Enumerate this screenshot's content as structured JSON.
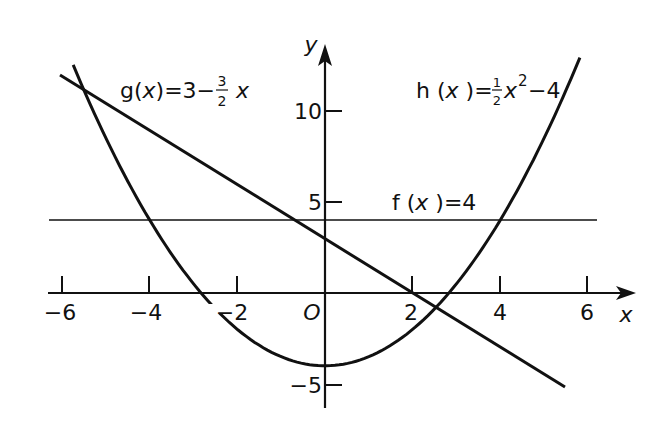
{
  "chart_data": {
    "type": "line",
    "title": "",
    "xlabel": "x",
    "ylabel": "y",
    "xlim": [
      -6.3,
      7.0
    ],
    "ylim": [
      -6.3,
      13.0
    ],
    "grid": false,
    "x_ticks": [
      -6,
      -4,
      -2,
      2,
      4,
      6
    ],
    "x_tick_labels": [
      "-6",
      "-4",
      "-2",
      "2",
      "4",
      "6"
    ],
    "y_ticks": [
      10,
      5,
      -5
    ],
    "y_tick_labels": [
      "10",
      "5",
      "-5"
    ],
    "origin_label": "O",
    "series": [
      {
        "name": "f(x)=4",
        "expression": "4",
        "x_range": [
          -6.3,
          6.2
        ],
        "x": [
          -6.3,
          6.2
        ],
        "y": [
          4,
          4
        ]
      },
      {
        "name": "g(x)=3-3/2x",
        "expression": "3 - 1.5x",
        "x_range": [
          -6.05,
          5.48
        ],
        "x": [
          -6,
          -4,
          -2,
          0,
          2,
          4,
          5.48
        ],
        "y": [
          12,
          9,
          6,
          3,
          0,
          -3,
          -5.22
        ]
      },
      {
        "name": "h(x)=1/2x^2-4",
        "expression": "0.5x^2 - 4",
        "x_range": [
          -5.75,
          5.82
        ],
        "x": [
          -5.75,
          -4,
          -2,
          0,
          2,
          4,
          5.82
        ],
        "y": [
          12.53,
          4,
          -2,
          -4,
          -2,
          4,
          12.94
        ]
      }
    ],
    "annotations": [
      {
        "text": "g(x)=3-3/2 x",
        "near": [
          -4.3,
          11.5
        ]
      },
      {
        "text": "h(x)=1/2x²-4",
        "near": [
          3.5,
          11.5
        ]
      },
      {
        "text": "f(x)=4",
        "near": [
          2.8,
          5
        ]
      }
    ]
  },
  "labels": {
    "g_name": "g(",
    "g_var": "x",
    "g_rest": ")=3−",
    "g_num": "3",
    "g_den": "2",
    "g_tail": "x",
    "h_name": "h (",
    "h_var": "x",
    "h_close": " )=",
    "h_num": "1",
    "h_den": "2",
    "h_var2": "x",
    "h_exp": "2",
    "h_tail": "−4",
    "f_name": "f (",
    "f_var": "x",
    "f_rest": " )=4",
    "x_axis": "x",
    "y_axis": "y",
    "origin": "O",
    "tick_x_m6": "−6",
    "tick_x_m4": "−4",
    "tick_x_m2": "−2",
    "tick_x_2": "2",
    "tick_x_4": "4",
    "tick_x_6": "6",
    "tick_y_10": "10",
    "tick_y_5": "5",
    "tick_y_m5": "−5"
  },
  "colors": {
    "ink": "#111111",
    "background": "#ffffff"
  }
}
